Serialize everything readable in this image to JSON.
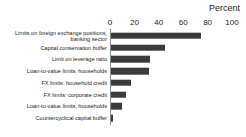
{
  "chart_data": {
    "type": "bar",
    "orientation": "horizontal",
    "title": "",
    "xlabel": "Percent",
    "ylabel": "",
    "xlim": [
      0,
      100
    ],
    "xticks": [
      0,
      20,
      40,
      60,
      80,
      100
    ],
    "grid": false,
    "legend": false,
    "bar_color": "#3b3b3b",
    "axis_color": "#8c8c8c",
    "categories": [
      "Limits on foreign exchange positions,\nbanking sector",
      "Capital conservation buffer",
      "Limit on leverage ratio",
      "Loan-to-value limits, households",
      "FX limits: household credit",
      "FX limits: corporate credit",
      "Loan-to-value limits, households",
      "Countercyclical capital buffer"
    ],
    "values": [
      74,
      44,
      32,
      31,
      16,
      12,
      9,
      2
    ]
  },
  "axis": {
    "title": "Percent",
    "ticks": [
      "0",
      "20",
      "40",
      "60",
      "80",
      "100"
    ]
  }
}
